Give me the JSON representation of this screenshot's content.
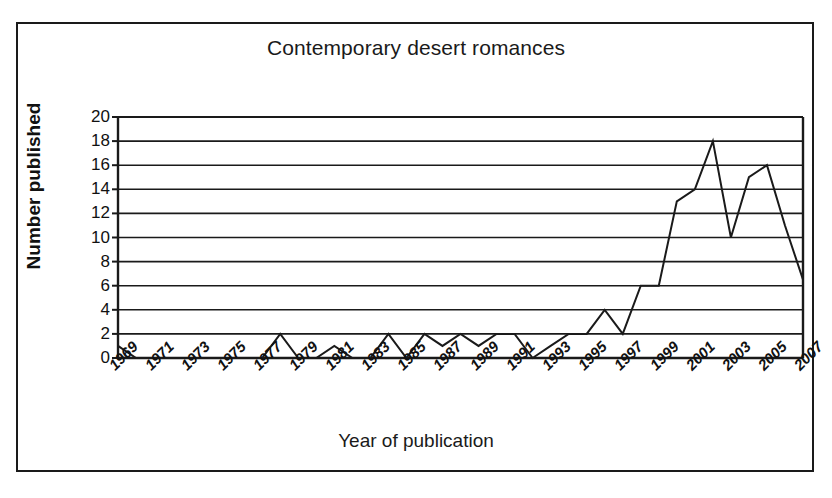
{
  "chart_data": {
    "type": "line",
    "title": "Contemporary desert romances",
    "xlabel": "Year of publication",
    "ylabel": "Number published",
    "xlim": [
      1969,
      2007
    ],
    "ylim": [
      0,
      20
    ],
    "yticks": [
      0,
      2,
      4,
      6,
      8,
      10,
      12,
      14,
      16,
      18,
      20
    ],
    "ytick_labels": [
      "0",
      "2",
      "4",
      "6",
      "8",
      "10",
      "12",
      "14",
      "16",
      "18",
      "20"
    ],
    "xticks": [
      1969,
      1971,
      1973,
      1975,
      1977,
      1979,
      1981,
      1983,
      1985,
      1987,
      1989,
      1991,
      1993,
      1995,
      1997,
      1999,
      2001,
      2003,
      2005,
      2007
    ],
    "xtick_labels": [
      "1969",
      "1971",
      "1973",
      "1975",
      "1977",
      "1979",
      "1981",
      "1983",
      "1985",
      "1987",
      "1989",
      "1991",
      "1993",
      "1995",
      "1997",
      "1999",
      "2001",
      "2003",
      "2005",
      "2007"
    ],
    "grid": "horizontal",
    "legend": "none",
    "line_color": "#1a1a1a",
    "x": [
      1969,
      1970,
      1971,
      1972,
      1973,
      1974,
      1975,
      1976,
      1977,
      1978,
      1979,
      1980,
      1981,
      1982,
      1983,
      1984,
      1985,
      1986,
      1987,
      1988,
      1989,
      1990,
      1991,
      1992,
      1993,
      1994,
      1995,
      1996,
      1997,
      1998,
      1999,
      2000,
      2001,
      2002,
      2003,
      2004,
      2005,
      2006,
      2007
    ],
    "values": [
      1,
      0,
      0,
      0,
      0,
      0,
      0,
      0,
      0,
      2,
      0,
      0,
      1,
      0,
      0,
      2,
      0,
      2,
      1,
      2,
      1,
      2,
      2,
      0,
      1,
      2,
      2,
      4,
      2,
      6,
      6,
      13,
      14,
      18,
      10,
      15,
      16,
      11,
      6.5
    ],
    "series": [
      {
        "name": "Number published",
        "values": [
          1,
          0,
          0,
          0,
          0,
          0,
          0,
          0,
          0,
          2,
          0,
          0,
          1,
          0,
          0,
          2,
          0,
          2,
          1,
          2,
          1,
          2,
          2,
          0,
          1,
          2,
          2,
          4,
          2,
          6,
          6,
          13,
          14,
          18,
          10,
          15,
          16,
          11,
          6.5
        ]
      }
    ]
  }
}
